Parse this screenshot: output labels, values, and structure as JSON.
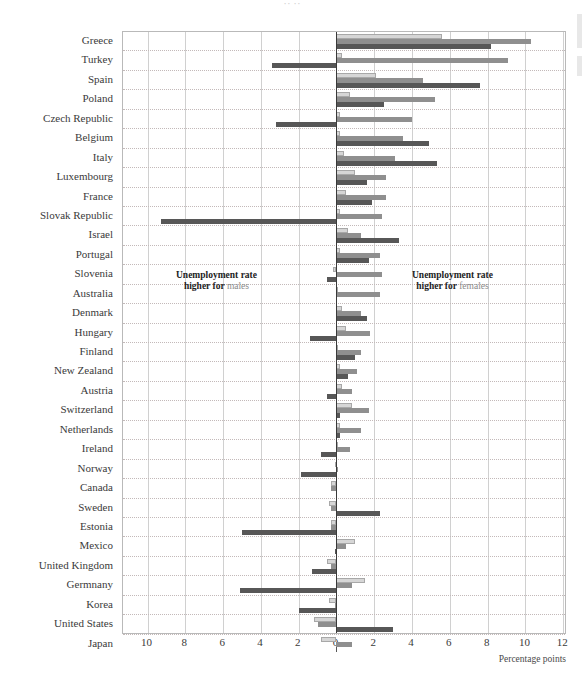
{
  "title_sliver": "·· ··",
  "axis": {
    "unit_label": "Percentage points",
    "ticks": [
      {
        "label": "10",
        "value": -10
      },
      {
        "label": "8",
        "value": -8
      },
      {
        "label": "6",
        "value": -6
      },
      {
        "label": "4",
        "value": -4
      },
      {
        "label": "2",
        "value": -2
      },
      {
        "label": "0",
        "value": 0
      },
      {
        "label": "2",
        "value": 2
      },
      {
        "label": "4",
        "value": 4
      },
      {
        "label": "6",
        "value": 6
      },
      {
        "label": "8",
        "value": 8
      },
      {
        "label": "10",
        "value": 10
      },
      {
        "label": "12",
        "value": 12
      }
    ],
    "min": -11.3,
    "max": 12.2
  },
  "annotations": {
    "left_line1": "Unemployment rate",
    "left_line2_bold": "higher for ",
    "left_line2_soft": "males",
    "right_line1": "Unemployment rate",
    "right_line2_bold": "higher for ",
    "right_line2_soft": "females"
  },
  "colors": {
    "series_light": "#d6d6d6",
    "series_medium": "#8f8f8f",
    "series_dark": "#575757",
    "zero_axis": "#3a3a3a",
    "grid": "#d0d0d0",
    "row_divider": "#c3b9b9"
  },
  "chart_data": {
    "type": "bar",
    "orientation": "horizontal-diverging",
    "title": "",
    "xlabel": "Percentage points",
    "ylabel": "",
    "xlim": [
      -11.3,
      12.2
    ],
    "grid": true,
    "legend_position": "none",
    "note": "Negative values plotted to the left of zero = unemployment rate higher for males; positive values to the right = higher for females. Three bars per country (three measurement series).",
    "categories": [
      "Greece",
      "Turkey",
      "Spain",
      "Poland",
      "Czech Republic",
      "Belgium",
      "Italy",
      "Luxembourg",
      "France",
      "Slovak Republic",
      "Israel",
      "Portugal",
      "Slovenia",
      "Australia",
      "Denmark",
      "Hungary",
      "Finland",
      "New Zealand",
      "Austria",
      "Switzerland",
      "Netherlands",
      "Ireland",
      "Norway",
      "Canada",
      "Sweden",
      "Estonia",
      "Mexico",
      "United Kingdom",
      "Germnany",
      "Korea",
      "United States",
      "Japan"
    ],
    "series": [
      {
        "name": "series-1",
        "color": "#d6d6d6",
        "values": [
          5.6,
          0.3,
          2.1,
          0.7,
          0.2,
          0.2,
          0.4,
          1.0,
          0.5,
          0.2,
          0.6,
          0.2,
          -0.2,
          0.1,
          0.3,
          0.5,
          0.1,
          0.2,
          0.3,
          0.8,
          0.2,
          0.1,
          -0.1,
          -0.3,
          -0.4,
          -0.3,
          1.0,
          -0.5,
          1.5,
          -0.4,
          -1.2,
          -0.8
        ]
      },
      {
        "name": "series-2",
        "color": "#8f8f8f",
        "values": [
          10.3,
          9.1,
          4.6,
          5.2,
          4.0,
          3.5,
          3.1,
          2.6,
          2.6,
          2.4,
          1.3,
          2.3,
          2.4,
          2.3,
          1.3,
          1.8,
          1.3,
          1.1,
          0.8,
          1.7,
          1.3,
          0.7,
          0.1,
          -0.3,
          -0.3,
          -0.3,
          0.5,
          -0.3,
          0.8,
          -0.1,
          -1.0,
          0.8
        ]
      },
      {
        "name": "series-3",
        "color": "#575757",
        "values": [
          8.2,
          -3.4,
          7.6,
          2.5,
          -3.2,
          4.9,
          5.3,
          1.6,
          1.9,
          -9.3,
          3.3,
          1.7,
          -0.5,
          0.0,
          1.6,
          -1.4,
          1.0,
          0.6,
          -0.5,
          0.2,
          0.2,
          -0.8,
          -1.9,
          0.0,
          2.3,
          -5.0,
          -0.1,
          -1.3,
          -5.1,
          -2.0,
          3.0,
          0.0
        ]
      }
    ]
  }
}
